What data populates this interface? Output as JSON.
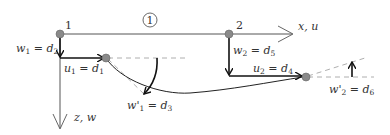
{
  "diagram": {
    "type": "beam-element-degrees-of-freedom",
    "element_label": "1",
    "nodes": [
      {
        "id": "1",
        "label": "1"
      },
      {
        "id": "2",
        "label": "2"
      }
    ],
    "axes": {
      "x_label": "x, u",
      "z_label": "z, w"
    },
    "dofs": [
      {
        "var": "w",
        "sub": "1",
        "eq": " = ",
        "d": "d",
        "dsub": "2",
        "prime": ""
      },
      {
        "var": "u",
        "sub": "1",
        "eq": " = ",
        "d": "d",
        "dsub": "1",
        "prime": ""
      },
      {
        "var": "w",
        "sub": "1",
        "eq": " = ",
        "d": "d",
        "dsub": "3",
        "prime": "'"
      },
      {
        "var": "w",
        "sub": "2",
        "eq": " = ",
        "d": "d",
        "dsub": "5",
        "prime": ""
      },
      {
        "var": "u",
        "sub": "2",
        "eq": " = ",
        "d": "d",
        "dsub": "4",
        "prime": ""
      },
      {
        "var": "w",
        "sub": "2",
        "eq": " = ",
        "d": "d",
        "dsub": "6",
        "prime": "'"
      }
    ],
    "colors": {
      "line": "#555555",
      "arrow": "#111111",
      "dashed": "#999999",
      "node_fill": "#8a8a8a"
    }
  }
}
